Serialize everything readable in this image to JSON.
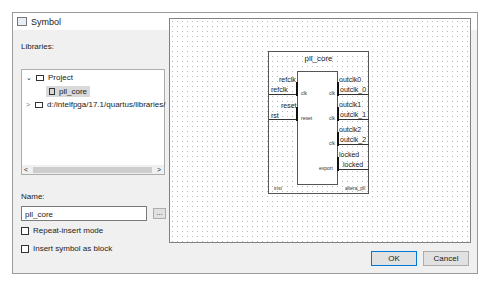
{
  "window": {
    "title": "Symbol",
    "close_label": "✕"
  },
  "libraries": {
    "label": "Libraries:",
    "tree": [
      {
        "label": "Project",
        "expanded": true,
        "icon": "folder-open-icon"
      },
      {
        "label": "pll_core",
        "selected": true,
        "icon": "symbol-icon"
      },
      {
        "label": "d:/intelfpga/17.1/quartus/libraries/",
        "expanded": false,
        "icon": "folder-icon"
      }
    ],
    "scroll_left": "<",
    "scroll_right": ">"
  },
  "name": {
    "label": "Name:",
    "value": "pll_core",
    "browse_label": "..."
  },
  "options": {
    "repeat_insert": "Repeat-insert mode",
    "insert_as_block": "Insert symbol as block"
  },
  "symbol": {
    "title": "pll_core",
    "inputs": [
      {
        "port": "refclk",
        "wire": "refclk",
        "inner": "clk"
      },
      {
        "port": "reset",
        "wire": "rst",
        "inner": "reset"
      }
    ],
    "outputs": [
      {
        "port": "outclk0",
        "wire": "outclk_0",
        "inner": "clk"
      },
      {
        "port": "outclk1",
        "wire": "outclk_1",
        "inner": "clk"
      },
      {
        "port": "outclk2",
        "wire": "outclk_2",
        "inner": "clk"
      },
      {
        "port": "locked",
        "wire": "locked",
        "inner": "export"
      }
    ],
    "instance": "inst",
    "module": "altera_pll"
  },
  "buttons": {
    "ok": "OK",
    "cancel": "Cancel"
  }
}
